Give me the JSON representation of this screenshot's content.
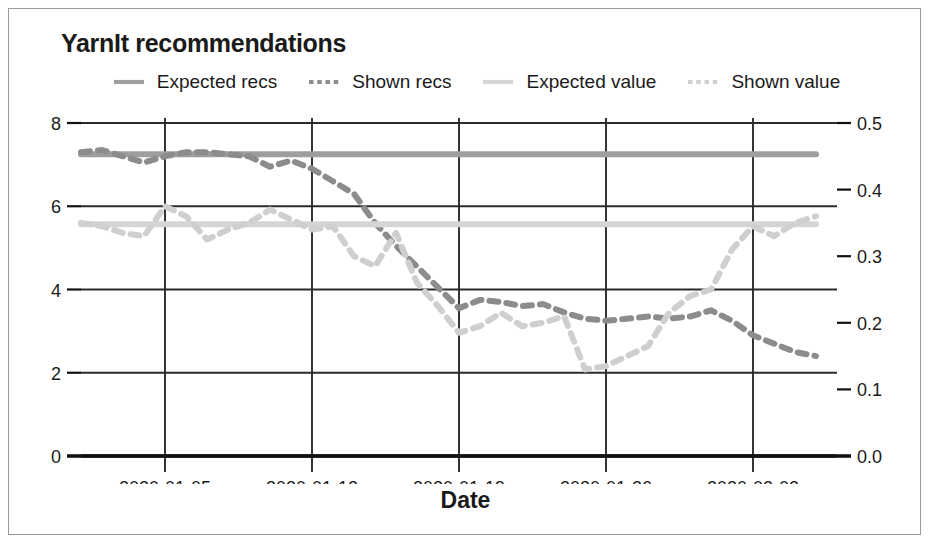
{
  "chart_data": {
    "type": "line",
    "title": "YarnIt recommendations",
    "xlabel": "Date",
    "ylabel": "",
    "grid": true,
    "legend_position": "top-center",
    "x_tick_labels": [
      "2020-01-05",
      "2020-01-12",
      "2020-01-19",
      "2020-01-26",
      "2020-02-02"
    ],
    "x_tick_values": [
      "2020-01-05",
      "2020-01-12",
      "2020-01-19",
      "2020-01-26",
      "2020-02-02"
    ],
    "x_range": [
      "2020-01-01",
      "2020-02-06"
    ],
    "left_axis": {
      "tick_labels": [
        "0",
        "2",
        "4",
        "6",
        "8"
      ],
      "tick_values": [
        0,
        2,
        4,
        6,
        8
      ],
      "ylim": [
        0,
        8
      ]
    },
    "right_axis": {
      "tick_labels": [
        "0.0",
        "0.1",
        "0.2",
        "0.3",
        "0.4",
        "0.5"
      ],
      "tick_values": [
        0.0,
        0.1,
        0.2,
        0.3,
        0.4,
        0.5
      ],
      "ylim": [
        0,
        0.5
      ]
    },
    "colors": {
      "expected_recs": "#9e9e9e",
      "shown_recs": "#8c8c8c",
      "expected_value": "#d5d5d5",
      "shown_value": "#cfcfcf",
      "grid": "#2b2b2b",
      "axis": "#111111"
    },
    "series": [
      {
        "name": "Expected recs",
        "axis": "left",
        "style": "solid",
        "color": "#9e9e9e",
        "x": [
          "2020-01-01",
          "2020-01-02",
          "2020-01-03",
          "2020-01-04",
          "2020-01-05",
          "2020-01-06",
          "2020-01-07",
          "2020-01-08",
          "2020-01-09",
          "2020-01-10",
          "2020-01-11",
          "2020-01-12",
          "2020-01-13",
          "2020-01-14",
          "2020-01-15",
          "2020-01-16",
          "2020-01-17",
          "2020-01-18",
          "2020-01-19",
          "2020-01-20",
          "2020-01-21",
          "2020-01-22",
          "2020-01-23",
          "2020-01-24",
          "2020-01-25",
          "2020-01-26",
          "2020-01-27",
          "2020-01-28",
          "2020-01-29",
          "2020-01-30",
          "2020-01-31",
          "2020-02-01",
          "2020-02-02",
          "2020-02-03",
          "2020-02-04",
          "2020-02-05"
        ],
        "values": [
          7.25,
          7.25,
          7.25,
          7.25,
          7.25,
          7.25,
          7.25,
          7.25,
          7.25,
          7.25,
          7.25,
          7.25,
          7.25,
          7.25,
          7.25,
          7.25,
          7.25,
          7.25,
          7.25,
          7.25,
          7.25,
          7.25,
          7.25,
          7.25,
          7.25,
          7.25,
          7.25,
          7.25,
          7.25,
          7.25,
          7.25,
          7.25,
          7.25,
          7.25,
          7.25,
          7.25
        ]
      },
      {
        "name": "Shown recs",
        "axis": "left",
        "style": "dashed",
        "color": "#8c8c8c",
        "x": [
          "2020-01-01",
          "2020-01-02",
          "2020-01-03",
          "2020-01-04",
          "2020-01-05",
          "2020-01-06",
          "2020-01-07",
          "2020-01-08",
          "2020-01-09",
          "2020-01-10",
          "2020-01-11",
          "2020-01-12",
          "2020-01-13",
          "2020-01-14",
          "2020-01-15",
          "2020-01-16",
          "2020-01-17",
          "2020-01-18",
          "2020-01-19",
          "2020-01-20",
          "2020-01-21",
          "2020-01-22",
          "2020-01-23",
          "2020-01-24",
          "2020-01-25",
          "2020-01-26",
          "2020-01-27",
          "2020-01-28",
          "2020-01-29",
          "2020-01-30",
          "2020-01-31",
          "2020-02-01",
          "2020-02-02",
          "2020-02-03",
          "2020-02-04",
          "2020-02-05"
        ],
        "values": [
          7.3,
          7.35,
          7.2,
          7.05,
          7.2,
          7.3,
          7.3,
          7.25,
          7.2,
          6.95,
          7.1,
          6.9,
          6.6,
          6.3,
          5.6,
          5.05,
          4.55,
          4.05,
          3.55,
          3.75,
          3.7,
          3.6,
          3.65,
          3.45,
          3.3,
          3.25,
          3.3,
          3.35,
          3.3,
          3.35,
          3.5,
          3.25,
          2.9,
          2.7,
          2.5,
          2.4
        ]
      },
      {
        "name": "Expected value",
        "axis": "right",
        "style": "solid",
        "color": "#d5d5d5",
        "x": [
          "2020-01-01",
          "2020-01-02",
          "2020-01-03",
          "2020-01-04",
          "2020-01-05",
          "2020-01-06",
          "2020-01-07",
          "2020-01-08",
          "2020-01-09",
          "2020-01-10",
          "2020-01-11",
          "2020-01-12",
          "2020-01-13",
          "2020-01-14",
          "2020-01-15",
          "2020-01-16",
          "2020-01-17",
          "2020-01-18",
          "2020-01-19",
          "2020-01-20",
          "2020-01-21",
          "2020-01-22",
          "2020-01-23",
          "2020-01-24",
          "2020-01-25",
          "2020-01-26",
          "2020-01-27",
          "2020-01-28",
          "2020-01-29",
          "2020-01-30",
          "2020-01-31",
          "2020-02-01",
          "2020-02-02",
          "2020-02-03",
          "2020-02-04",
          "2020-02-05"
        ],
        "values": [
          0.348,
          0.348,
          0.348,
          0.348,
          0.348,
          0.348,
          0.348,
          0.348,
          0.348,
          0.348,
          0.348,
          0.348,
          0.348,
          0.348,
          0.348,
          0.348,
          0.348,
          0.348,
          0.348,
          0.348,
          0.348,
          0.348,
          0.348,
          0.348,
          0.348,
          0.348,
          0.348,
          0.348,
          0.348,
          0.348,
          0.348,
          0.348,
          0.348,
          0.348,
          0.348,
          0.348
        ]
      },
      {
        "name": "Shown value",
        "axis": "right",
        "style": "dashed",
        "color": "#cfcfcf",
        "x": [
          "2020-01-01",
          "2020-01-02",
          "2020-01-03",
          "2020-01-04",
          "2020-01-05",
          "2020-01-06",
          "2020-01-07",
          "2020-01-08",
          "2020-01-09",
          "2020-01-10",
          "2020-01-11",
          "2020-01-12",
          "2020-01-13",
          "2020-01-14",
          "2020-01-15",
          "2020-01-16",
          "2020-01-17",
          "2020-01-18",
          "2020-01-19",
          "2020-01-20",
          "2020-01-21",
          "2020-01-22",
          "2020-01-23",
          "2020-01-24",
          "2020-01-25",
          "2020-01-26",
          "2020-01-27",
          "2020-01-28",
          "2020-01-29",
          "2020-01-30",
          "2020-01-31",
          "2020-02-01",
          "2020-02-02",
          "2020-02-03",
          "2020-02-04",
          "2020-02-05"
        ],
        "values": [
          0.35,
          0.345,
          0.335,
          0.33,
          0.375,
          0.36,
          0.325,
          0.34,
          0.35,
          0.37,
          0.355,
          0.34,
          0.345,
          0.3,
          0.285,
          0.335,
          0.26,
          0.225,
          0.185,
          0.195,
          0.215,
          0.195,
          0.2,
          0.21,
          0.13,
          0.135,
          0.15,
          0.165,
          0.215,
          0.24,
          0.25,
          0.31,
          0.345,
          0.33,
          0.35,
          0.36
        ]
      }
    ]
  },
  "legend": {
    "items": [
      {
        "label": "Expected recs",
        "style": "solid",
        "color": "#9e9e9e"
      },
      {
        "label": "Shown recs",
        "style": "dashed",
        "color": "#8c8c8c"
      },
      {
        "label": "Expected value",
        "style": "solid",
        "color": "#d5d5d5"
      },
      {
        "label": "Shown value",
        "style": "dashed",
        "color": "#cfcfcf"
      }
    ]
  }
}
